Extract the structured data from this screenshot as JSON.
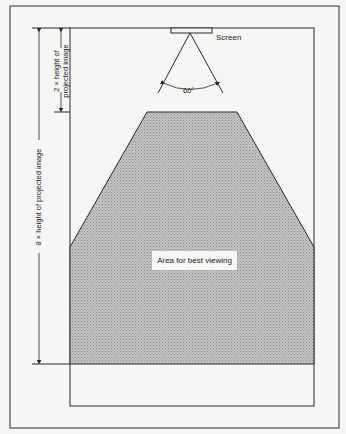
{
  "diagram": {
    "screen_label": "Screen",
    "angle_label": "60°",
    "area_label": "Area for best viewing",
    "dim_short_line1": "2 × height of",
    "dim_short_line2": "projected image",
    "dim_long": "8 × height of projected image"
  },
  "colors": {
    "line": "#2a2a2a",
    "area_fill": "#b9b9b9",
    "background": "#f6f6f4"
  }
}
